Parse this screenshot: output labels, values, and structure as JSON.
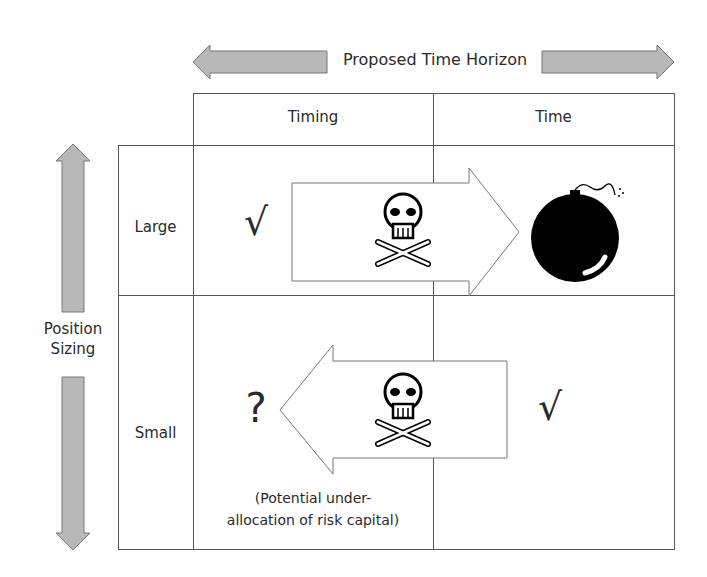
{
  "title": "Proposed Time Horizon",
  "columns": [
    "Timing",
    "Time"
  ],
  "rows": [
    "Large",
    "Small"
  ],
  "row_axis_label": [
    "Position",
    "Sizing"
  ],
  "cells": {
    "large_timing": {
      "symbol": "√"
    },
    "large_time": {
      "icon": "bomb-icon"
    },
    "small_timing": {
      "symbol": "?",
      "note_line1": "(Potential under-",
      "note_line2": "allocation of risk capital)"
    },
    "small_time": {
      "symbol": "√"
    }
  },
  "arrows": {
    "top_arrow": {
      "direction": "right",
      "icon": "skull-crossbones-icon"
    },
    "bottom_arrow": {
      "direction": "left",
      "icon": "skull-crossbones-icon"
    }
  },
  "colors": {
    "arrow_fill": "#b8b8b8",
    "grid": "#555555",
    "bomb": "#000000"
  }
}
